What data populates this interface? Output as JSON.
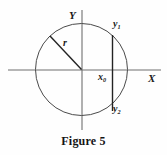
{
  "figure": {
    "caption": "Figure 5",
    "background_color": "#fefefe",
    "stroke_color": "#3a3a3a",
    "axis_color": "#6b6b6b",
    "label_color": "#1a1a1a"
  },
  "axes": {
    "y_axis_label": "Y",
    "x_axis_label": "X",
    "horizontal": {
      "x1": 8,
      "y1": 70,
      "x2": 161,
      "y2": 70
    },
    "vertical": {
      "x1": 82,
      "y1": 10,
      "x2": 82,
      "y2": 130
    }
  },
  "circle": {
    "center_x": 81.5,
    "center_y": 69.5,
    "radius": 46
  },
  "radius_segment": {
    "label": "r",
    "from_x": 81.5,
    "from_y": 69.5,
    "to_x": 50,
    "to_y": 36
  },
  "chord": {
    "x": 112.5,
    "top_y": 35,
    "bottom_y": 111,
    "upper_label": "y",
    "upper_subscript": "1",
    "lower_label": "y",
    "lower_subscript": "2"
  },
  "abscissa": {
    "label": "x",
    "subscript": "0"
  }
}
